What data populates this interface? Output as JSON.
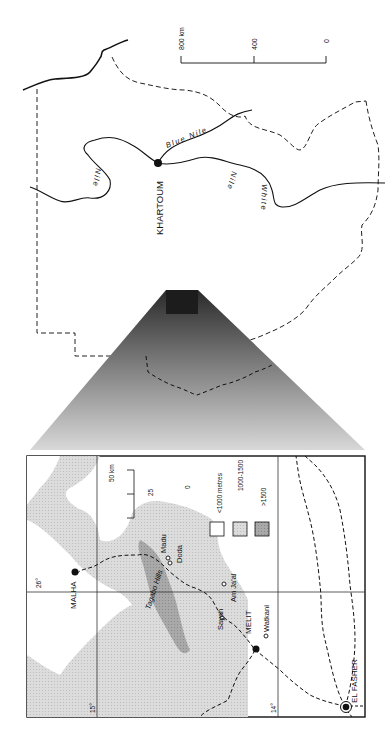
{
  "figure": {
    "orientation": "rotated 90 degrees counter-clockwise",
    "overview_map": {
      "capital": "KHARTOUM",
      "rivers": [
        "Blue Nile",
        "White Nile",
        "Nile"
      ],
      "scale_bar": {
        "labels": [
          "800 km",
          "400",
          "0"
        ]
      }
    },
    "inset_map": {
      "places": {
        "malha": "MALHA",
        "madu": "Madu",
        "doda": "Doda",
        "tagabo": "Tagabo Hills",
        "sayah": "Sayah",
        "amjaal": "Am Ja'al",
        "melit": "MELIT",
        "watkani": "Watkani",
        "elfasher": "EL FASHER"
      },
      "graticule": {
        "lon": "26°",
        "lat15": "15°",
        "lat14": "14°"
      },
      "scale_bar": {
        "labels": [
          "50 km",
          "25",
          "0"
        ]
      },
      "legend": {
        "items": [
          {
            "label": "<1000 metres",
            "color": "#ffffff"
          },
          {
            "label": "1000-1500",
            "color": "#d6d6d6"
          },
          {
            "label": ">1500",
            "color": "#a8a8a8"
          }
        ]
      }
    },
    "colors": {
      "ink": "#111111",
      "low_relief": "#d6d6d6",
      "high_relief": "#a8a8a8",
      "highlight_box": "#1c1c1c"
    }
  }
}
